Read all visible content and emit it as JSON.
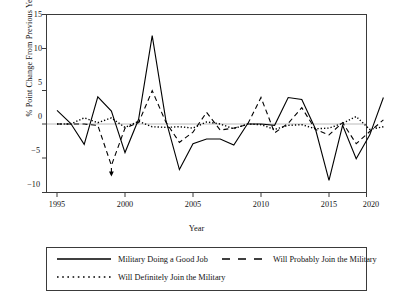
{
  "chart_data": {
    "type": "line",
    "title": "",
    "subtitle": "",
    "xlabel": "Year",
    "ylabel": "% Point Change From Previous Year",
    "xlim": [
      1995,
      2020
    ],
    "ylim": [
      -10,
      15
    ],
    "xticks": [
      "1995",
      "2000",
      "2005",
      "2010",
      "2015",
      "2020"
    ],
    "yticks": [
      "15",
      "10",
      "5",
      "0",
      "-5",
      "-10"
    ],
    "grid": false,
    "zero_line": true,
    "legend_position": "below-plot",
    "x": [
      1995,
      1996,
      1997,
      1998,
      1999,
      2000,
      2001,
      2002,
      2003,
      2004,
      2005,
      2006,
      2007,
      2008,
      2009,
      2010,
      2011,
      2012,
      2013,
      2014,
      2015,
      2016,
      2017,
      2018,
      2019
    ],
    "series": [
      {
        "name": "Military Doing a Good Job",
        "style": "solid",
        "values": [
          2.0,
          0.1,
          -3.0,
          4.0,
          1.9,
          -4.2,
          0.7,
          13.0,
          0.6,
          -6.7,
          -2.9,
          -2.2,
          -2.2,
          -3.1,
          0.0,
          0.0,
          -0.2,
          3.9,
          3.6,
          -0.7,
          -8.3,
          -0.2,
          -5.1,
          -1.6,
          3.9
        ]
      },
      {
        "name": "Will Probably Join the Military",
        "style": "dashed",
        "values": [
          0.0,
          0.0,
          0.0,
          -0.2,
          -6.1,
          -0.6,
          0.2,
          4.9,
          0.3,
          -2.7,
          -1.2,
          1.7,
          -0.9,
          -0.6,
          -0.1,
          3.9,
          -1.3,
          0.1,
          2.4,
          -0.8,
          -1.6,
          0.2,
          -2.9,
          -1.1,
          0.6
        ]
      },
      {
        "name": "Will Definitely Join the Military",
        "style": "dotted",
        "values": [
          0.0,
          0.0,
          0.9,
          0.2,
          0.9,
          -0.5,
          0.4,
          -0.4,
          -0.5,
          -0.4,
          -0.6,
          0.3,
          0.0,
          -0.7,
          0.0,
          -0.1,
          -0.8,
          -0.2,
          -0.1,
          -0.7,
          -0.6,
          0.1,
          1.1,
          -0.8,
          -0.4
        ]
      }
    ],
    "annotations": [
      {
        "type": "arrow-marker",
        "x": 1999,
        "y": -7.5,
        "series": "Will Probably Join the Military"
      }
    ]
  },
  "axes": {
    "ylabel": "% Point Change From Previous Year",
    "xlabel": "Year",
    "yticks": [
      {
        "label": "15",
        "value": 15
      },
      {
        "label": "10",
        "value": 10
      },
      {
        "label": "5",
        "value": 5
      },
      {
        "label": "0",
        "value": 0
      },
      {
        "label": "−5",
        "value": -5
      },
      {
        "label": "−10",
        "value": -10
      }
    ],
    "xticks": [
      {
        "label": "1995",
        "value": 1995
      },
      {
        "label": "2000",
        "value": 2000
      },
      {
        "label": "2005",
        "value": 2005
      },
      {
        "label": "2010",
        "value": 2010
      },
      {
        "label": "2015",
        "value": 2015
      },
      {
        "label": "2020",
        "value": 2020
      }
    ]
  },
  "legend": {
    "entries": [
      {
        "label": "Military Doing a Good Job",
        "style": "solid"
      },
      {
        "label": "Will Probably Join the Military",
        "style": "dashed"
      },
      {
        "label": "Will Definitely Join the Military",
        "style": "dotted"
      }
    ]
  },
  "colors": {
    "line": "#000000",
    "frame": "#3a3a3a",
    "zero_line": "#9a9a9a",
    "background": "#ffffff"
  }
}
